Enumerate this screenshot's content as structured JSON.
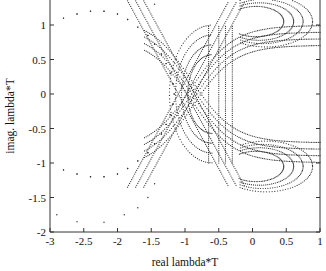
{
  "chart_data": {
    "type": "scatter",
    "title": "",
    "xlabel": "real lambda*T",
    "ylabel": "imag. lambda*T",
    "xlim": [
      -3,
      1
    ],
    "ylim": [
      -2,
      1.35
    ],
    "xticks": [
      "-3",
      "-2.5",
      "-2",
      "-1.5",
      "-1",
      "-0.5",
      "0",
      "0.5",
      "1"
    ],
    "yticks": [
      "-2",
      "-1.5",
      "-1",
      "-0.5",
      "0",
      "0.5",
      "1"
    ],
    "grid": false,
    "legend": null,
    "marker": "dot",
    "series": [
      {
        "name": "outer-circle-sparse",
        "points": [
          [
            -2.8,
            1.1
          ],
          [
            -2.6,
            1.16
          ],
          [
            -2.4,
            1.2
          ],
          [
            -2.2,
            1.2
          ],
          [
            -2.0,
            1.16
          ],
          [
            -1.85,
            1.08
          ],
          [
            -1.7,
            0.97
          ],
          [
            -1.55,
            0.85
          ],
          [
            -1.45,
            0.72
          ],
          [
            -1.35,
            0.58
          ],
          [
            -1.28,
            0.44
          ],
          [
            -1.22,
            0.3
          ],
          [
            -1.18,
            0.15
          ],
          [
            -1.16,
            0.0
          ],
          [
            -1.18,
            -0.15
          ],
          [
            -1.22,
            -0.3
          ],
          [
            -1.28,
            -0.44
          ],
          [
            -1.35,
            -0.58
          ],
          [
            -1.45,
            -0.72
          ],
          [
            -1.55,
            -0.85
          ],
          [
            -1.7,
            -0.97
          ],
          [
            -1.85,
            -1.08
          ],
          [
            -2.0,
            -1.16
          ],
          [
            -2.2,
            -1.2
          ],
          [
            -2.4,
            -1.2
          ],
          [
            -2.6,
            -1.16
          ],
          [
            -2.8,
            -1.1
          ]
        ]
      },
      {
        "name": "lower-sparse",
        "points": [
          [
            -2.9,
            -1.75
          ],
          [
            -2.6,
            -1.85
          ],
          [
            -2.2,
            -1.86
          ],
          [
            -1.9,
            -1.75
          ],
          [
            -1.7,
            -1.65
          ],
          [
            -1.55,
            -1.5
          ],
          [
            -1.45,
            -1.3
          ]
        ]
      },
      {
        "name": "curve-a",
        "points": [
          [
            -1.4,
            0.35
          ],
          [
            -1.1,
            0.15
          ],
          [
            -0.9,
            0.0
          ],
          [
            -0.7,
            -0.15
          ],
          [
            -0.4,
            -0.3
          ],
          [
            0.0,
            -0.45
          ],
          [
            0.4,
            -0.6
          ],
          [
            0.7,
            -0.75
          ],
          [
            1.0,
            -0.85
          ]
        ]
      },
      {
        "name": "curve-b",
        "points": [
          [
            -1.4,
            -0.35
          ],
          [
            -1.1,
            -0.15
          ],
          [
            -0.9,
            0.0
          ],
          [
            -0.7,
            0.15
          ],
          [
            -0.4,
            0.3
          ],
          [
            0.0,
            0.45
          ],
          [
            0.4,
            0.6
          ],
          [
            0.7,
            0.75
          ],
          [
            1.0,
            0.85
          ]
        ]
      }
    ]
  }
}
